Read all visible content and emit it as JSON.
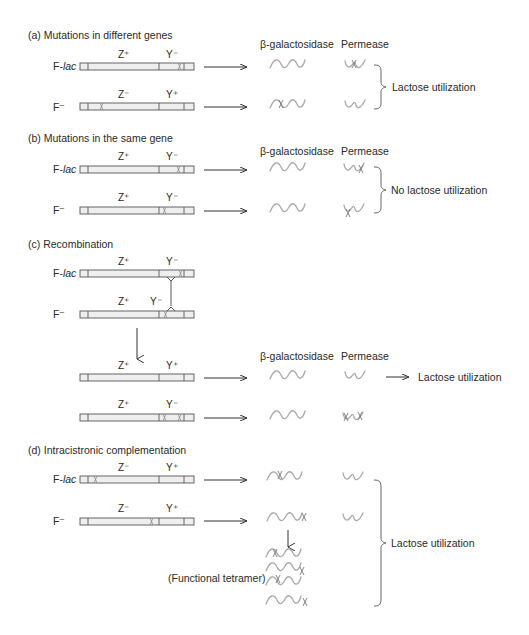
{
  "column_headers": {
    "enzyme": "β-galactosidase",
    "permease": "Permease"
  },
  "strains": {
    "f_lac_prefix": "F-",
    "f_lac_italic": "lac",
    "f_minus": "F⁻"
  },
  "panels": [
    {
      "id": "a",
      "title": "(a) Mutations in different genes",
      "rows": [
        {
          "strain": "F-lac",
          "z": "Z⁺",
          "y": "Y⁻",
          "mutations": [
            "Y"
          ]
        },
        {
          "strain": "F⁻",
          "z": "Z⁻",
          "y": "Y⁺",
          "mutations": [
            "Z"
          ]
        }
      ],
      "result": "Lactose utilization"
    },
    {
      "id": "b",
      "title": "(b) Mutations in the same gene",
      "rows": [
        {
          "strain": "F-lac",
          "z": "Z⁺",
          "y": "Y⁻",
          "mutations": [
            "Y-right"
          ]
        },
        {
          "strain": "F⁻",
          "z": "Z⁺",
          "y": "Y⁻",
          "mutations": [
            "Y-left"
          ]
        }
      ],
      "result": "No lactose utilization"
    },
    {
      "id": "c",
      "title": "(c) Recombination",
      "rows": [
        {
          "strain": "F-lac",
          "z": "Z⁺",
          "y": "Y⁻",
          "mutations": [
            "Y-right"
          ]
        },
        {
          "strain": "F⁻",
          "z": "Z⁺",
          "y": "Y⁻",
          "mutations": [
            "Y-left"
          ]
        }
      ],
      "products": [
        {
          "z": "Z⁺",
          "y": "Y⁺",
          "mutations": [],
          "result": "Lactose utilization"
        },
        {
          "z": "Z⁺",
          "y": "Y⁻",
          "mutations": [
            "Y-left",
            "Y-right"
          ],
          "result": ""
        }
      ]
    },
    {
      "id": "d",
      "title": "(d) Intracistronic complementation",
      "rows": [
        {
          "strain": "F-lac",
          "z": "Z⁻",
          "y": "Y⁺",
          "mutations": [
            "Z-left"
          ]
        },
        {
          "strain": "F⁻",
          "z": "Z⁻",
          "y": "Y⁺",
          "mutations": [
            "Z-right"
          ]
        }
      ],
      "tetramer_label": "(Functional tetramer)",
      "result": "Lactose utilization"
    }
  ]
}
